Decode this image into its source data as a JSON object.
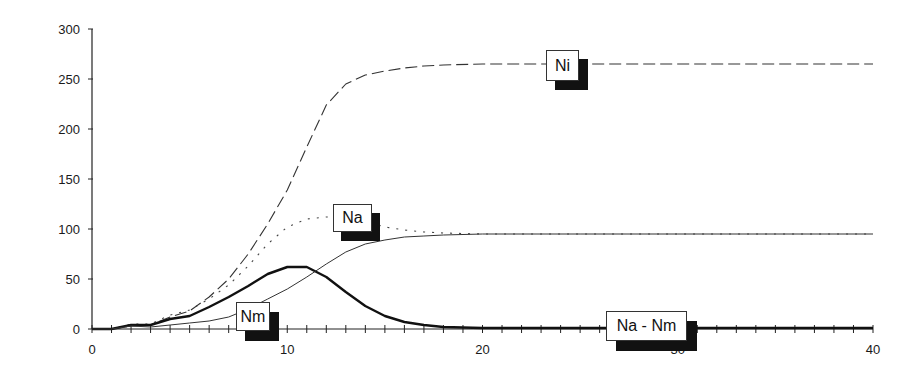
{
  "chart_data": {
    "type": "line",
    "title": "",
    "xlabel": "",
    "ylabel": "",
    "xlim": [
      0,
      40
    ],
    "ylim": [
      0,
      300
    ],
    "x_ticks": [
      0,
      10,
      20,
      30,
      40
    ],
    "y_ticks": [
      0,
      50,
      100,
      150,
      200,
      250,
      300
    ],
    "grid": false,
    "legend": "inline labels",
    "x": [
      0,
      1,
      2,
      3,
      4,
      5,
      6,
      7,
      8,
      9,
      10,
      11,
      12,
      13,
      14,
      15,
      16,
      17,
      18,
      20,
      25,
      30,
      35,
      40
    ],
    "series": [
      {
        "name": "Ni",
        "style": "dashed",
        "values": [
          0,
          0,
          3,
          4,
          12,
          18,
          32,
          50,
          75,
          105,
          139,
          182,
          224,
          245,
          254,
          258,
          261,
          263,
          264,
          265,
          265,
          265,
          265,
          265
        ]
      },
      {
        "name": "Na",
        "style": "dotted",
        "values": [
          0,
          0,
          5,
          5,
          14,
          19,
          30,
          44,
          63,
          85,
          102,
          110,
          112,
          112,
          108,
          102,
          99,
          97,
          96,
          95,
          95,
          95,
          95,
          95
        ]
      },
      {
        "name": "Nm",
        "style": "solid-thick",
        "values": [
          0,
          0,
          4,
          4,
          10,
          13,
          22,
          32,
          43,
          55,
          62,
          62,
          52,
          37,
          23,
          13,
          7,
          4,
          2,
          1,
          1,
          1,
          1,
          1
        ]
      },
      {
        "name": "Na - Nm",
        "style": "solid-thin",
        "values": [
          0,
          0,
          3,
          2,
          4,
          6,
          8,
          12,
          20,
          30,
          40,
          52,
          65,
          77,
          85,
          89,
          92,
          93,
          94,
          95,
          95,
          95,
          95,
          95
        ]
      }
    ],
    "annotations": [
      {
        "text": "Ni",
        "series": "Ni"
      },
      {
        "text": "Na",
        "series": "Na"
      },
      {
        "text": "Nm",
        "series": "Nm"
      },
      {
        "text": "Na - Nm",
        "series": "Na - Nm"
      }
    ]
  },
  "axis": {
    "y_labels": [
      "300",
      "250",
      "200",
      "150",
      "100",
      "50",
      "0"
    ],
    "x_labels": [
      "0",
      "10",
      "20",
      "30",
      "40"
    ]
  },
  "labels": {
    "ni": "Ni",
    "na": "Na",
    "nm": "Nm",
    "na_nm": "Na - Nm"
  }
}
